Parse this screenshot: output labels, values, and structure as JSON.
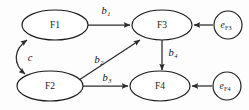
{
  "diagram": {
    "type": "path-diagram",
    "background_color": "#fdfdfd",
    "stroke_color": "#2b2b2b",
    "text_color": "#1a1a1a",
    "nodes": [
      {
        "id": "F1",
        "label": "F1",
        "shape": "ellipse",
        "cx": 55,
        "cy": 25,
        "rx": 33,
        "ry": 15
      },
      {
        "id": "F2",
        "label": "F2",
        "shape": "ellipse",
        "cx": 50,
        "cy": 86,
        "rx": 33,
        "ry": 15
      },
      {
        "id": "F3",
        "label": "F3",
        "shape": "ellipse",
        "cx": 162,
        "cy": 25,
        "rx": 30,
        "ry": 15
      },
      {
        "id": "F4",
        "label": "F4",
        "shape": "ellipse",
        "cx": 160,
        "cy": 86,
        "rx": 30,
        "ry": 15
      },
      {
        "id": "eF3",
        "label": "e",
        "sublabel": "F3",
        "shape": "circle",
        "cx": 228,
        "cy": 25,
        "r": 14
      },
      {
        "id": "eF4",
        "label": "e",
        "sublabel": "F4",
        "shape": "circle",
        "cx": 227,
        "cy": 86,
        "r": 14
      }
    ],
    "edges": [
      {
        "id": "b1",
        "from": "F1",
        "to": "F3",
        "label": "b",
        "sublabel": "1",
        "style": "straight",
        "arrow": "single"
      },
      {
        "id": "b2",
        "from": "F2",
        "to": "F3",
        "label": "b",
        "sublabel": "2",
        "style": "straight",
        "arrow": "single"
      },
      {
        "id": "b3",
        "from": "F2",
        "to": "F4",
        "label": "b",
        "sublabel": "3",
        "style": "straight",
        "arrow": "single"
      },
      {
        "id": "b4",
        "from": "F3",
        "to": "F4",
        "label": "b",
        "sublabel": "4",
        "style": "straight",
        "arrow": "single"
      },
      {
        "id": "c",
        "from": "F1",
        "to": "F2",
        "label": "c",
        "sublabel": "",
        "style": "curved",
        "arrow": "double"
      },
      {
        "id": "eF3-F3",
        "from": "eF3",
        "to": "F3",
        "label": "",
        "sublabel": "",
        "style": "straight",
        "arrow": "single"
      },
      {
        "id": "eF4-F4",
        "from": "eF4",
        "to": "F4",
        "label": "",
        "sublabel": "",
        "style": "straight",
        "arrow": "single"
      }
    ],
    "labels": {
      "F1": "F1",
      "F2": "F2",
      "F3": "F3",
      "F4": "F4",
      "eF3_main": "e",
      "eF3_sub": "F3",
      "eF4_main": "e",
      "eF4_sub": "F4",
      "b1_main": "b",
      "b1_sub": "1",
      "b2_main": "b",
      "b2_sub": "2",
      "b3_main": "b",
      "b3_sub": "3",
      "b4_main": "b",
      "b4_sub": "4",
      "c_main": "c"
    }
  }
}
